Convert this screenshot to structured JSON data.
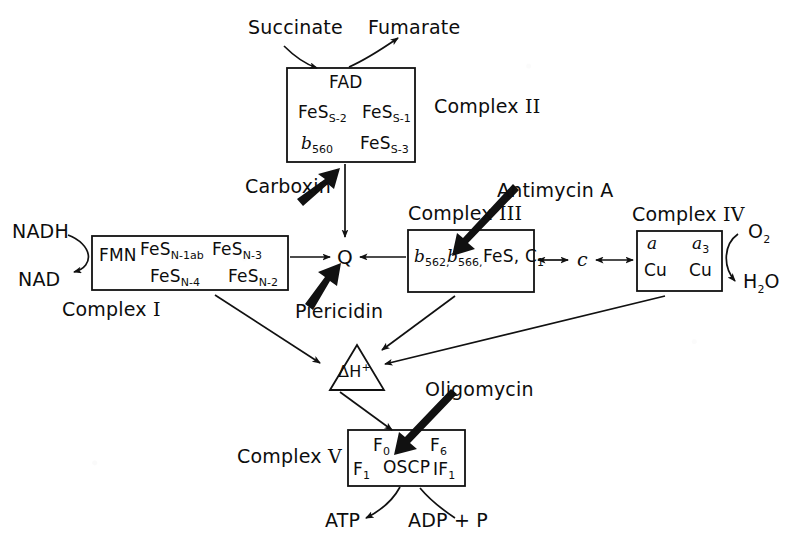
{
  "figure": {
    "ink_color": "#111111",
    "background_color": "#ffffff"
  },
  "substrates": {
    "succinate": "Succinate",
    "fumarate": "Fumarate",
    "nadh": "NADH",
    "nad": "NAD",
    "oxygen": "O",
    "oxygen_sub": "2",
    "water_h": "H",
    "water_sub": "2",
    "water_o": "O",
    "atp": "ATP",
    "adp_p": "ADP + P"
  },
  "complexes": {
    "one": {
      "label": "Complex",
      "numeral": "I",
      "contents": [
        {
          "text": "FMN",
          "sub": ""
        },
        {
          "text": "FeS",
          "sub": "N-1ab"
        },
        {
          "text": "FeS",
          "sub": "N-3"
        },
        {
          "text": "FeS",
          "sub": "N-4"
        },
        {
          "text": "FeS",
          "sub": "N-2"
        }
      ]
    },
    "two": {
      "label": "Complex",
      "numeral": "II",
      "contents": [
        {
          "text": "FAD",
          "sub": ""
        },
        {
          "text": "FeS",
          "sub": "S-2"
        },
        {
          "text": "FeS",
          "sub": "S-1"
        },
        {
          "text": "b",
          "sub": "560",
          "italic": true
        },
        {
          "text": "FeS",
          "sub": "S-3"
        }
      ]
    },
    "three": {
      "label": "Complex",
      "numeral": "III",
      "contents": [
        {
          "text": "b",
          "sub": "562,",
          "italic": true
        },
        {
          "text": "b",
          "sub": "566,",
          "italic": true
        },
        {
          "text": "FeS, C",
          "sub": "1"
        }
      ]
    },
    "four": {
      "label": "Complex",
      "numeral": "IV",
      "contents": [
        {
          "text": "a",
          "sub": "",
          "italic": true
        },
        {
          "text": "a",
          "sub": "3",
          "italic": true
        },
        {
          "text": "Cu",
          "sub": ""
        },
        {
          "text": "Cu",
          "sub": ""
        }
      ]
    },
    "five": {
      "label": "Complex",
      "numeral": "V",
      "contents": [
        {
          "text": "F",
          "sub": "0"
        },
        {
          "text": "F",
          "sub": "6"
        },
        {
          "text": "F",
          "sub": "1"
        },
        {
          "text": "OSCP",
          "sub": ""
        },
        {
          "text": "IF",
          "sub": "1"
        }
      ]
    }
  },
  "carriers": {
    "q": "Q",
    "cytochrome_c": "c"
  },
  "proton_node": {
    "delta": "ΔH",
    "charge": "+"
  },
  "inhibitors": [
    {
      "name": "Carboxin",
      "target": "Complex II"
    },
    {
      "name": "Piericidin",
      "target": "Complex I / Q"
    },
    {
      "name": "Antimycin A",
      "target": "Complex III"
    },
    {
      "name": "Oligomycin",
      "target": "Complex V"
    }
  ]
}
